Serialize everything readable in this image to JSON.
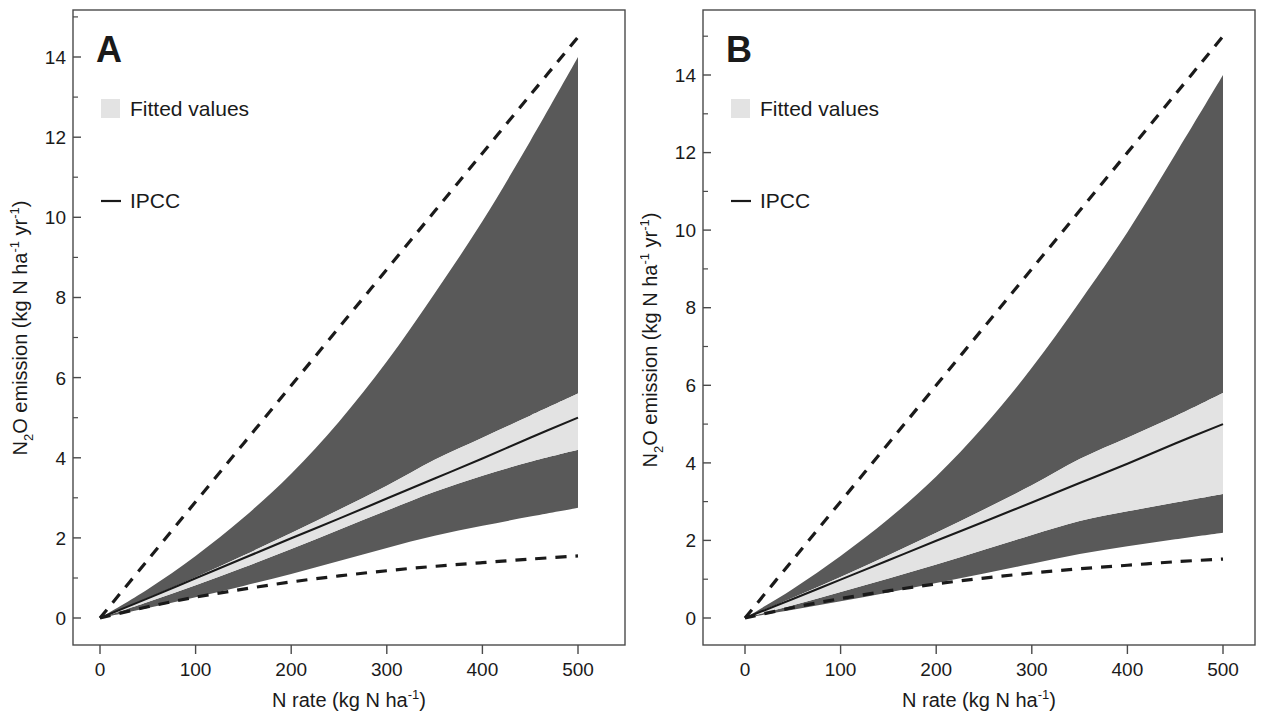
{
  "figure": {
    "background": "#ffffff",
    "panels": [
      {
        "letter": "A",
        "legend": {
          "fitted_label": "Fitted values",
          "ipcc_label": "IPCC",
          "fitted_swatch_color": "#e3e3e3",
          "ipcc_line_color": "#1a1a1a"
        },
        "axes": {
          "xlabel_main": "N rate (kg N ha",
          "xlabel_sup": "-1",
          "xlabel_tail": ")",
          "ylabel_a": "N",
          "ylabel_sub": "2",
          "ylabel_b": "O emission (kg N ha",
          "ylabel_sup1": "-1",
          "ylabel_c": " yr",
          "ylabel_sup2": "-1",
          "ylabel_tail": ")"
        }
      },
      {
        "letter": "B",
        "legend": {
          "fitted_label": "Fitted values",
          "ipcc_label": "IPCC",
          "fitted_swatch_color": "#e3e3e3",
          "ipcc_line_color": "#1a1a1a"
        },
        "axes": {
          "xlabel_main": "N rate (kg N ha",
          "xlabel_sup": "-1",
          "xlabel_tail": ")",
          "ylabel_a": "N",
          "ylabel_sub": "2",
          "ylabel_b": "O emission (kg N ha",
          "ylabel_sup1": "-1",
          "ylabel_c": " yr",
          "ylabel_sup2": "-1",
          "ylabel_tail": ")"
        }
      }
    ]
  },
  "chart_data": [
    {
      "type": "area",
      "panel": "A",
      "title": "A",
      "xlabel": "N rate (kg N ha-1)",
      "ylabel": "N2O emission (kg N ha-1 yr-1)",
      "xlim": [
        0,
        520
      ],
      "ylim": [
        0,
        15.4
      ],
      "xticks": [
        0,
        100,
        200,
        300,
        400,
        500
      ],
      "xtick_labels": [
        "0",
        "100",
        "200",
        "300",
        "400",
        "500"
      ],
      "yticks": [
        0,
        2,
        4,
        6,
        8,
        10,
        12,
        14
      ],
      "ytick_labels": [
        "0",
        "2",
        "4",
        "6",
        "8",
        "10",
        "12",
        "14"
      ],
      "minor_yticks": [
        1,
        3,
        5,
        7,
        9,
        11,
        13,
        15
      ],
      "grid": false,
      "legend_position": "upper-left",
      "x": [
        0,
        50,
        100,
        150,
        200,
        250,
        300,
        350,
        400,
        450,
        500
      ],
      "series": [
        {
          "name": "Outer upper bound (dark band top)",
          "color": "#595959",
          "values": [
            0.0,
            0.72,
            1.55,
            2.5,
            3.6,
            4.9,
            6.4,
            8.1,
            9.9,
            11.9,
            14.0
          ]
        },
        {
          "name": "Inner upper bound (fitted band top)",
          "color": "#e3e3e3",
          "values": [
            0.0,
            0.5,
            1.02,
            1.56,
            2.12,
            2.7,
            3.3,
            3.95,
            4.5,
            5.05,
            5.6
          ]
        },
        {
          "name": "IPCC fitted mean",
          "color": "#1a1a1a",
          "values": [
            0.0,
            0.49,
            0.99,
            1.49,
            1.99,
            2.48,
            2.98,
            3.48,
            3.98,
            4.5,
            5.0
          ]
        },
        {
          "name": "Inner lower bound (fitted band bottom)",
          "color": "#e3e3e3",
          "values": [
            0.0,
            0.4,
            0.82,
            1.26,
            1.72,
            2.2,
            2.68,
            3.15,
            3.55,
            3.9,
            4.2
          ]
        },
        {
          "name": "Outer lower bound (dark band bottom)",
          "color": "#595959",
          "values": [
            0.0,
            0.25,
            0.52,
            0.8,
            1.1,
            1.42,
            1.75,
            2.05,
            2.3,
            2.53,
            2.75
          ]
        },
        {
          "name": "Upper dashed reference",
          "color": "#1a1a1a",
          "style": "dashed",
          "values": [
            0.0,
            1.45,
            2.9,
            4.35,
            5.8,
            7.25,
            8.7,
            10.15,
            11.6,
            13.05,
            14.5
          ]
        },
        {
          "name": "Lower dashed reference",
          "color": "#1a1a1a",
          "style": "dashed",
          "values": [
            0.0,
            0.28,
            0.52,
            0.72,
            0.9,
            1.05,
            1.18,
            1.29,
            1.38,
            1.47,
            1.55
          ]
        }
      ]
    },
    {
      "type": "area",
      "panel": "B",
      "title": "B",
      "xlabel": "N rate (kg N ha-1)",
      "ylabel": "N2O emission (kg N ha-1 yr-1)",
      "xlim": [
        0,
        520
      ],
      "ylim": [
        0,
        15.4
      ],
      "xticks": [
        0,
        100,
        200,
        300,
        400,
        500
      ],
      "xtick_labels": [
        "0",
        "100",
        "200",
        "300",
        "400",
        "500"
      ],
      "yticks": [
        0,
        2,
        4,
        6,
        8,
        10,
        12,
        14
      ],
      "ytick_labels": [
        "0",
        "2",
        "4",
        "6",
        "8",
        "10",
        "12",
        "14"
      ],
      "minor_yticks": [
        1,
        3,
        5,
        7,
        9,
        11,
        13,
        15
      ],
      "grid": false,
      "legend_position": "upper-left",
      "x": [
        0,
        50,
        100,
        150,
        200,
        250,
        300,
        350,
        400,
        450,
        500
      ],
      "series": [
        {
          "name": "Outer upper bound (dark band top)",
          "color": "#595959",
          "values": [
            0.0,
            0.75,
            1.6,
            2.55,
            3.65,
            4.95,
            6.45,
            8.15,
            9.95,
            11.95,
            14.0
          ]
        },
        {
          "name": "Inner upper bound (fitted band top)",
          "color": "#e3e3e3",
          "values": [
            0.0,
            0.52,
            1.06,
            1.62,
            2.2,
            2.8,
            3.42,
            4.1,
            4.65,
            5.2,
            5.8
          ]
        },
        {
          "name": "IPCC fitted mean",
          "color": "#1a1a1a",
          "values": [
            0.0,
            0.49,
            0.99,
            1.49,
            1.99,
            2.48,
            2.98,
            3.48,
            3.98,
            4.5,
            5.0
          ]
        },
        {
          "name": "Inner lower bound (fitted band bottom)",
          "color": "#e3e3e3",
          "values": [
            0.0,
            0.33,
            0.67,
            1.02,
            1.38,
            1.76,
            2.14,
            2.5,
            2.75,
            2.98,
            3.2
          ]
        },
        {
          "name": "Outer lower bound (dark band bottom)",
          "color": "#595959",
          "values": [
            0.0,
            0.21,
            0.43,
            0.66,
            0.9,
            1.15,
            1.4,
            1.65,
            1.85,
            2.03,
            2.2
          ]
        },
        {
          "name": "Upper dashed reference",
          "color": "#1a1a1a",
          "style": "dashed",
          "values": [
            0.0,
            1.5,
            3.0,
            4.5,
            6.0,
            7.5,
            9.0,
            10.5,
            12.0,
            13.5,
            15.0
          ]
        },
        {
          "name": "Lower dashed reference",
          "color": "#1a1a1a",
          "style": "dashed",
          "values": [
            0.0,
            0.27,
            0.5,
            0.7,
            0.88,
            1.03,
            1.16,
            1.27,
            1.36,
            1.45,
            1.52
          ]
        }
      ]
    }
  ]
}
